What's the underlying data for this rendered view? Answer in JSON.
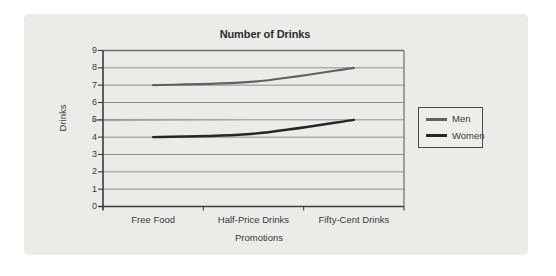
{
  "chart_data": {
    "type": "line",
    "title": "Number of Drinks",
    "xlabel": "Promotions",
    "ylabel": "Drinks",
    "categories": [
      "Free Food",
      "Half-Price Drinks",
      "Fifty-Cent Drinks"
    ],
    "series": [
      {
        "name": "Men",
        "values": [
          7,
          7.2,
          8
        ],
        "color": "#616161"
      },
      {
        "name": "Women",
        "values": [
          4,
          4.2,
          5
        ],
        "color": "#262626"
      }
    ],
    "ylim": [
      0,
      9
    ],
    "yticks": [
      0,
      1,
      2,
      3,
      4,
      5,
      6,
      7,
      8,
      9
    ],
    "grid": true,
    "legend_position": "right-outside",
    "colors": {
      "panel_background": "#ebebe8",
      "gridline": "#8e8e8e",
      "axis": "#3c3c3c",
      "text": "#3a3a3a"
    }
  }
}
